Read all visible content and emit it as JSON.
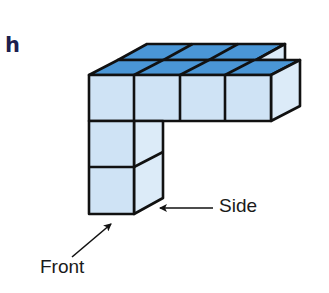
{
  "figure": {
    "label": "h",
    "annotations": {
      "side": "Side",
      "front": "Front"
    },
    "colors": {
      "top_face": "#4a96d6",
      "front_face": "#cfe3f5",
      "side_face": "#dcebf8",
      "edge": "#111111",
      "label": "#1c1f4f"
    }
  }
}
